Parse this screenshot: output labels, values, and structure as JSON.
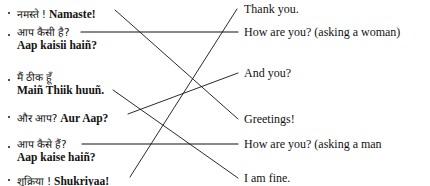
{
  "exercise": {
    "type": "matching-worksheet",
    "ink_color": "#121212"
  },
  "left_column": {
    "name": "hindi-phrases",
    "items": [
      {
        "id": "namaste",
        "devanagari": "नमस्ते !",
        "romanized": "Namaste!",
        "inline": true,
        "top": 4,
        "anchor_x": 115,
        "anchor_y": 10
      },
      {
        "id": "aap-kaisii-hain",
        "devanagari": "आप कैसी है?",
        "romanized": "Aap kaisii haiñ?",
        "inline": false,
        "top": 26,
        "anchor_x": 81,
        "anchor_y": 32
      },
      {
        "id": "main-thiik-huun",
        "devanagari": "मैं ठीक हूँ",
        "romanized": "Maiñ Thiik huuñ.",
        "inline": false,
        "top": 71,
        "anchor_x": 113,
        "anchor_y": 90
      },
      {
        "id": "aur-aap",
        "devanagari": "और आप?",
        "romanized": "Aur Aap?",
        "inline": true,
        "top": 108,
        "anchor_x": 128,
        "anchor_y": 114
      },
      {
        "id": "aap-kaise-hain",
        "devanagari": "आप कैसे हैं?",
        "romanized": "Aap kaise haiñ?",
        "inline": false,
        "top": 138,
        "anchor_x": 82,
        "anchor_y": 144
      },
      {
        "id": "shukriyaa",
        "devanagari": "शुक्रिया !",
        "romanized": "Shukriyaa!",
        "inline": true,
        "top": 171,
        "anchor_x": 130,
        "anchor_y": 177
      }
    ]
  },
  "right_column": {
    "name": "english-meanings",
    "items": [
      {
        "id": "thank-you",
        "text": "Thank you.",
        "top": 3,
        "anchor_x": 237,
        "anchor_y": 9
      },
      {
        "id": "how-are-you-f",
        "text": "How are you? (asking a woman)",
        "top": 26,
        "anchor_x": 238,
        "anchor_y": 32
      },
      {
        "id": "and-you",
        "text": "And you?",
        "top": 67,
        "anchor_x": 238,
        "anchor_y": 73
      },
      {
        "id": "greetings",
        "text": "Greetings!",
        "top": 113,
        "anchor_x": 238,
        "anchor_y": 119
      },
      {
        "id": "how-are-you-m",
        "text": "How are you? (asking a man",
        "top": 138,
        "anchor_x": 238,
        "anchor_y": 144
      },
      {
        "id": "i-am-fine",
        "text": "I am fine.",
        "top": 172,
        "anchor_x": 238,
        "anchor_y": 178
      }
    ]
  },
  "connectors": [
    {
      "id": "namaste-to-greetings",
      "from": "namaste",
      "to": "greetings",
      "x1": 115,
      "y1": 10,
      "x2": 238,
      "y2": 119,
      "style": "diagonal"
    },
    {
      "id": "kaisii-to-how-are-you-woman",
      "from": "aap-kaisii-hain",
      "to": "how-are-you-f",
      "x1": 81,
      "y1": 32,
      "x2": 238,
      "y2": 32,
      "style": "horizontal"
    },
    {
      "id": "thiik-to-i-am-fine",
      "from": "main-thiik-huun",
      "to": "i-am-fine",
      "x1": 113,
      "y1": 90,
      "x2": 238,
      "y2": 178,
      "style": "diagonal"
    },
    {
      "id": "aur-aap-to-and-you",
      "from": "aur-aap",
      "to": "and-you",
      "x1": 128,
      "y1": 114,
      "x2": 238,
      "y2": 73,
      "style": "diagonal"
    },
    {
      "id": "kaise-to-how-are-you-man",
      "from": "aap-kaise-hain",
      "to": "how-are-you-m",
      "x1": 82,
      "y1": 144,
      "x2": 238,
      "y2": 144,
      "style": "horizontal"
    },
    {
      "id": "shukriyaa-to-thank-you",
      "from": "shukriyaa",
      "to": "thank-you",
      "x1": 130,
      "y1": 177,
      "x2": 237,
      "y2": 9,
      "style": "diagonal"
    }
  ]
}
